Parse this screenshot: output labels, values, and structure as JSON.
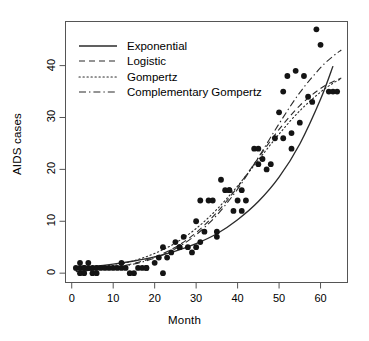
{
  "chart_data": {
    "type": "scatter",
    "title": "",
    "xlabel": "Month",
    "ylabel": "AIDS cases",
    "xlim": [
      -1.5,
      66.5
    ],
    "ylim": [
      -1.8,
      48.5
    ],
    "xticks": [
      0,
      10,
      20,
      30,
      40,
      50,
      60
    ],
    "yticks": [
      0,
      10,
      20,
      30,
      40
    ],
    "grid": false,
    "legend_position": "top-left inside axes",
    "legend": [
      {
        "label": "Exponential",
        "style": "solid"
      },
      {
        "label": "Logistic",
        "style": "dashed"
      },
      {
        "label": "Gompertz",
        "style": "dotted"
      },
      {
        "label": "Complementary Gompertz",
        "style": "dashdot"
      }
    ],
    "points": [
      [
        1,
        1
      ],
      [
        2,
        1
      ],
      [
        2,
        0
      ],
      [
        2,
        2
      ],
      [
        3,
        1
      ],
      [
        3,
        0
      ],
      [
        3,
        1
      ],
      [
        4,
        2
      ],
      [
        4,
        1
      ],
      [
        5,
        0
      ],
      [
        5,
        1
      ],
      [
        6,
        0
      ],
      [
        6,
        1
      ],
      [
        7,
        1
      ],
      [
        8,
        1
      ],
      [
        9,
        1
      ],
      [
        10,
        1
      ],
      [
        11,
        1
      ],
      [
        12,
        1
      ],
      [
        12,
        2
      ],
      [
        13,
        1
      ],
      [
        14,
        0
      ],
      [
        15,
        0
      ],
      [
        16,
        1
      ],
      [
        17,
        1
      ],
      [
        18,
        1
      ],
      [
        18,
        1
      ],
      [
        20,
        2
      ],
      [
        21,
        3
      ],
      [
        22,
        0
      ],
      [
        22,
        5
      ],
      [
        23,
        3
      ],
      [
        24,
        4
      ],
      [
        25,
        6
      ],
      [
        26,
        5
      ],
      [
        26,
        5
      ],
      [
        27,
        7
      ],
      [
        28,
        5
      ],
      [
        29,
        4
      ],
      [
        30,
        10
      ],
      [
        30,
        5
      ],
      [
        31,
        14
      ],
      [
        31,
        6
      ],
      [
        32,
        8
      ],
      [
        33,
        14
      ],
      [
        34,
        14
      ],
      [
        35,
        7
      ],
      [
        35,
        8
      ],
      [
        36,
        18
      ],
      [
        37,
        16
      ],
      [
        38,
        16
      ],
      [
        38,
        16
      ],
      [
        39,
        12
      ],
      [
        40,
        14
      ],
      [
        41,
        16
      ],
      [
        41,
        12
      ],
      [
        42,
        14
      ],
      [
        44,
        24
      ],
      [
        45,
        24
      ],
      [
        45,
        21
      ],
      [
        46,
        22
      ],
      [
        47,
        20
      ],
      [
        48,
        21
      ],
      [
        49,
        26
      ],
      [
        50,
        31
      ],
      [
        51,
        35
      ],
      [
        51,
        26
      ],
      [
        52,
        38
      ],
      [
        53,
        27
      ],
      [
        53,
        24
      ],
      [
        54,
        39
      ],
      [
        55,
        29
      ],
      [
        56,
        38
      ],
      [
        57,
        34
      ],
      [
        58,
        33
      ],
      [
        59,
        47
      ],
      [
        60,
        44
      ],
      [
        62,
        35
      ],
      [
        63,
        35
      ],
      [
        64,
        35
      ]
    ],
    "curves": [
      {
        "name": "Exponential",
        "style": "solid",
        "x": [
          1,
          5,
          10,
          15,
          20,
          25,
          30,
          35,
          40,
          45,
          50,
          55,
          60,
          63
        ],
        "y": [
          1.05,
          1.3,
          1.75,
          2.35,
          3.15,
          4.25,
          5.7,
          7.6,
          10.3,
          13.8,
          18.5,
          24.9,
          33.5,
          39.9
        ]
      },
      {
        "name": "Logistic",
        "style": "dashed",
        "x": [
          1,
          5,
          10,
          15,
          20,
          25,
          30,
          35,
          40,
          45,
          50,
          55,
          60,
          63,
          65
        ],
        "y": [
          0.35,
          0.6,
          1.1,
          1.9,
          3.1,
          5.0,
          7.8,
          11.7,
          16.6,
          22.2,
          27.7,
          32.3,
          35.6,
          36.9,
          37.6
        ]
      },
      {
        "name": "Gompertz",
        "style": "dotted",
        "x": [
          1,
          5,
          10,
          15,
          20,
          25,
          30,
          35,
          40,
          45,
          50,
          55,
          60,
          63,
          65
        ],
        "y": [
          0.5,
          0.85,
          1.45,
          2.4,
          3.8,
          5.8,
          8.6,
          12.3,
          16.8,
          21.8,
          26.8,
          31.3,
          34.9,
          36.6,
          37.5
        ]
      },
      {
        "name": "Complementary Gompertz",
        "style": "dashdot",
        "x": [
          1,
          5,
          10,
          15,
          20,
          25,
          30,
          35,
          40,
          45,
          50,
          55,
          60,
          63,
          65
        ],
        "y": [
          0.3,
          0.55,
          1.0,
          1.75,
          2.9,
          4.7,
          7.4,
          11.2,
          16.2,
          22.3,
          28.8,
          34.8,
          39.6,
          41.8,
          43.0
        ]
      }
    ]
  },
  "axes": {
    "x_tick_labels": [
      "0",
      "10",
      "20",
      "30",
      "40",
      "50",
      "60"
    ],
    "y_tick_labels": [
      "0",
      "10",
      "20",
      "30",
      "40"
    ],
    "xlabel": "Month",
    "ylabel": "AIDS cases"
  },
  "style": {
    "point_color": "#141414",
    "line_color": "#2b2b2b",
    "axis_color": "#555555",
    "background": "#ffffff"
  }
}
